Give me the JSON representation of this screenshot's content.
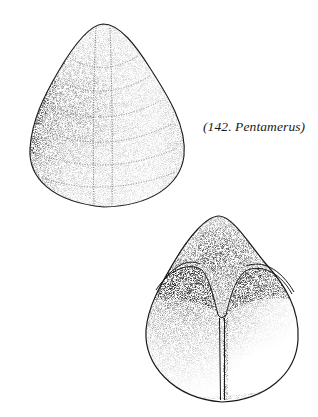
{
  "figure": {
    "caption": "(142. Pentamerus)",
    "specimens": [
      {
        "name": "pentamerus-exterior-view",
        "description": "Exterior of valve showing growth lines and median ridge"
      },
      {
        "name": "pentamerus-interior-view",
        "description": "Interior of valve showing spondylium and median septum"
      }
    ],
    "colors": {
      "ink": "#1a1a1a",
      "background": "#ffffff"
    }
  }
}
